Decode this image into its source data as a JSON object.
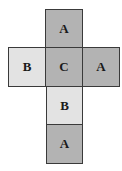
{
  "diagram": {
    "type": "cube-net",
    "colors": {
      "dark_face": "#b3b3b3",
      "light_face": "#e3e3e3",
      "border": "#3a3a3a",
      "text": "#1a1a1a"
    },
    "faces": [
      {
        "id": "top",
        "label": "A",
        "shade": "dark",
        "row": 0,
        "col": 1
      },
      {
        "id": "left",
        "label": "B",
        "shade": "light",
        "row": 1,
        "col": 0
      },
      {
        "id": "center",
        "label": "C",
        "shade": "dark",
        "row": 1,
        "col": 1
      },
      {
        "id": "right",
        "label": "A",
        "shade": "dark",
        "row": 1,
        "col": 2
      },
      {
        "id": "below1",
        "label": "B",
        "shade": "light",
        "row": 2,
        "col": 1
      },
      {
        "id": "below2",
        "label": "A",
        "shade": "dark",
        "row": 3,
        "col": 1
      }
    ]
  }
}
